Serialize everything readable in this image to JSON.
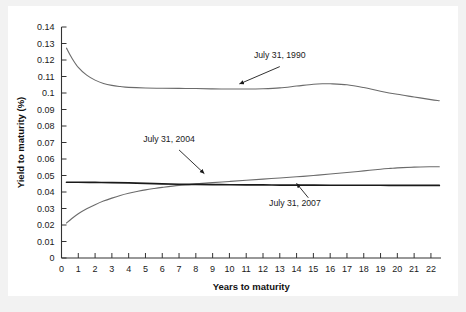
{
  "figure": {
    "background_color": "#f2f2f2",
    "panel_color": "#ffffff"
  },
  "chart_data": {
    "type": "line",
    "title": "",
    "xlabel": "Years to maturity",
    "ylabel": "Yield to maturity (%)",
    "xlim": [
      0,
      22.6
    ],
    "ylim": [
      0,
      0.14
    ],
    "grid": false,
    "legend_position": "inline-annotations",
    "xticks": [
      0,
      1,
      2,
      3,
      4,
      5,
      6,
      7,
      8,
      9,
      10,
      11,
      12,
      13,
      14,
      15,
      16,
      17,
      18,
      19,
      20,
      21,
      22
    ],
    "xticklabels": [
      "0",
      "1",
      "2",
      "3",
      "4",
      "5",
      "6",
      "7",
      "8",
      "9",
      "10",
      "11",
      "12",
      "13",
      "14",
      "15",
      "16",
      "17",
      "18",
      "19",
      "20",
      "21",
      "22"
    ],
    "yticks": [
      0,
      0.01,
      0.02,
      0.03,
      0.04,
      0.05,
      0.06,
      0.07,
      0.08,
      0.09,
      0.1,
      0.11,
      0.12,
      0.13,
      0.14
    ],
    "yticklabels": [
      "0",
      "0.01",
      "0.02",
      "0.03",
      "0.04",
      "0.05",
      "0.06",
      "0.07",
      "0.08",
      "0.09",
      "0.1",
      "0.11",
      "0.12",
      "0.13",
      "0.14"
    ],
    "series": [
      {
        "name": "July 31, 1990",
        "color": "#6b6b6b",
        "width": 1.1,
        "x": [
          0.3,
          0.6,
          1.0,
          1.5,
          2.0,
          2.5,
          3.0,
          3.5,
          4.0,
          5.0,
          6.0,
          7.0,
          8.0,
          9.0,
          10.0,
          11.0,
          12.0,
          13.0,
          14.0,
          15.0,
          15.6,
          16.0,
          17.0,
          18.0,
          19.0,
          20.0,
          21.0,
          22.0,
          22.5
        ],
        "y": [
          0.1272,
          0.1215,
          0.1155,
          0.1108,
          0.1078,
          0.1058,
          0.1046,
          0.1039,
          0.1034,
          0.103,
          0.1029,
          0.1028,
          0.1027,
          0.1025,
          0.1024,
          0.1024,
          0.1026,
          0.1031,
          0.1042,
          0.1053,
          0.1056,
          0.1056,
          0.105,
          0.1033,
          0.1011,
          0.0992,
          0.0976,
          0.096,
          0.0953
        ]
      },
      {
        "name": "July 31, 2004",
        "color": "#6b6b6b",
        "width": 1.1,
        "x": [
          0.3,
          0.6,
          1.0,
          1.5,
          2.0,
          2.5,
          3.0,
          3.5,
          4.0,
          4.5,
          5.0,
          5.5,
          6.0,
          7.0,
          8.0,
          9.0,
          10.0,
          11.0,
          12.0,
          13.0,
          14.0,
          15.0,
          16.0,
          17.0,
          18.0,
          19.0,
          19.6,
          20.0,
          21.0,
          22.0,
          22.5
        ],
        "y": [
          0.0212,
          0.0238,
          0.0268,
          0.0298,
          0.0323,
          0.0345,
          0.0363,
          0.0379,
          0.0392,
          0.0403,
          0.0413,
          0.0421,
          0.0428,
          0.044,
          0.0449,
          0.0457,
          0.0464,
          0.0471,
          0.0478,
          0.0485,
          0.0492,
          0.05,
          0.0509,
          0.0518,
          0.0528,
          0.0538,
          0.0543,
          0.0546,
          0.0551,
          0.0553,
          0.0553
        ]
      },
      {
        "name": "July 31, 2007",
        "color": "#1a1a1a",
        "width": 1.7,
        "x": [
          0.3,
          1.0,
          2.0,
          3.0,
          4.0,
          5.0,
          6.0,
          7.0,
          8.0,
          9.0,
          10.0,
          11.0,
          12.0,
          13.0,
          14.0,
          15.0,
          16.0,
          17.0,
          18.0,
          19.0,
          20.0,
          21.0,
          22.0,
          22.5
        ],
        "y": [
          0.0459,
          0.0459,
          0.0458,
          0.0457,
          0.0455,
          0.0452,
          0.0449,
          0.0447,
          0.0446,
          0.0445,
          0.0444,
          0.0443,
          0.0443,
          0.0442,
          0.0442,
          0.0442,
          0.0441,
          0.0441,
          0.0441,
          0.0441,
          0.044,
          0.044,
          0.044,
          0.044
        ]
      }
    ],
    "annotations": [
      {
        "text": "July 31, 1990",
        "text_x": 13.0,
        "text_y": 0.1215,
        "arrow_from_x": 13.0,
        "arrow_from_y": 0.116,
        "arrow_to_x": 10.6,
        "arrow_to_y": 0.1055
      },
      {
        "text": "July 31, 2004",
        "text_x": 6.4,
        "text_y": 0.0705,
        "arrow_from_x": 7.0,
        "arrow_from_y": 0.0655,
        "arrow_to_x": 8.5,
        "arrow_to_y": 0.0512
      },
      {
        "text": "July 31, 2007",
        "text_x": 13.9,
        "text_y": 0.0318,
        "arrow_from_x": 14.7,
        "arrow_from_y": 0.0365,
        "arrow_to_x": 14.0,
        "arrow_to_y": 0.0452
      }
    ]
  }
}
